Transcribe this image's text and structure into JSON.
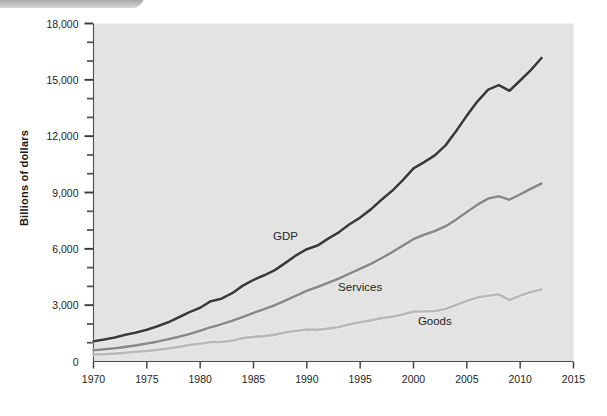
{
  "figure": {
    "background_color": "#ffffff",
    "plot_background_color": "#e3e3e3",
    "banner": {
      "name": "top-left-banner",
      "color": "#7d7d7d"
    }
  },
  "chart_data": {
    "type": "line",
    "title": "",
    "subtitle": "",
    "xlabel": "",
    "ylabel": "Billions of dollars",
    "xlim": [
      1970,
      2015
    ],
    "ylim": [
      0,
      18000
    ],
    "grid": false,
    "legend_position": "inline-annotations",
    "x_ticks": [
      1970,
      1975,
      1980,
      1985,
      1990,
      1995,
      2000,
      2005,
      2010,
      2015
    ],
    "x_tick_labels": [
      "1970",
      "1975",
      "1980",
      "1985",
      "1990",
      "1995",
      "2000",
      "2005",
      "2010",
      "2015"
    ],
    "y_ticks": [
      0,
      3000,
      6000,
      9000,
      12000,
      15000,
      18000
    ],
    "y_tick_labels": [
      "0",
      "3,000",
      "6,000",
      "9,000",
      "12,000",
      "15,000",
      "18,000"
    ],
    "y_minor_tick_interval": 1000,
    "x": [
      1970,
      1971,
      1972,
      1973,
      1974,
      1975,
      1976,
      1977,
      1978,
      1979,
      1980,
      1981,
      1982,
      1983,
      1984,
      1985,
      1986,
      1987,
      1988,
      1989,
      1990,
      1991,
      1992,
      1993,
      1994,
      1995,
      1996,
      1997,
      1998,
      1999,
      2000,
      2001,
      2002,
      2003,
      2004,
      2005,
      2006,
      2007,
      2008,
      2009,
      2010,
      2011,
      2012
    ],
    "series": [
      {
        "name": "GDP",
        "color": "#3a3a3a",
        "label_x": 1988,
        "label_y": 6450,
        "values": [
          1076,
          1168,
          1282,
          1429,
          1549,
          1689,
          1878,
          2086,
          2357,
          2632,
          2863,
          3211,
          3345,
          3638,
          4041,
          4347,
          4590,
          4870,
          5253,
          5658,
          5980,
          6174,
          6539,
          6879,
          7309,
          7664,
          8100,
          8609,
          9089,
          9661,
          10285,
          10622,
          10978,
          11511,
          12275,
          13094,
          13856,
          14478,
          14719,
          14419,
          14964,
          15518,
          16163
        ],
        "end_value_display": "15,700"
      },
      {
        "name": "Services",
        "color": "#8a8a8a",
        "label_x": 1995,
        "label_y": 3750,
        "values": [
          600,
          650,
          710,
          780,
          860,
          960,
          1060,
          1180,
          1320,
          1470,
          1640,
          1830,
          1990,
          2170,
          2370,
          2590,
          2790,
          3000,
          3250,
          3510,
          3770,
          3970,
          4190,
          4420,
          4680,
          4940,
          5200,
          5500,
          5820,
          6170,
          6520,
          6750,
          6950,
          7200,
          7560,
          7960,
          8350,
          8680,
          8800,
          8620,
          8900,
          9200,
          9480
        ],
        "end_value_display": "7,200"
      },
      {
        "name": "Goods",
        "color": "#b8b8b8",
        "label_x": 2002,
        "label_y": 1950,
        "values": [
          370,
          390,
          420,
          470,
          520,
          560,
          620,
          690,
          780,
          880,
          950,
          1040,
          1040,
          1110,
          1250,
          1310,
          1350,
          1430,
          1540,
          1640,
          1700,
          1690,
          1750,
          1840,
          1980,
          2090,
          2190,
          2310,
          2390,
          2500,
          2660,
          2660,
          2690,
          2800,
          3010,
          3230,
          3410,
          3500,
          3580,
          3270,
          3510,
          3700,
          3840
        ],
        "end_value_display": "3,600"
      }
    ],
    "annotations": [
      {
        "text": "GDP",
        "series": "GDP"
      },
      {
        "text": "Services",
        "series": "Services"
      },
      {
        "text": "Goods",
        "series": "Goods"
      }
    ]
  }
}
